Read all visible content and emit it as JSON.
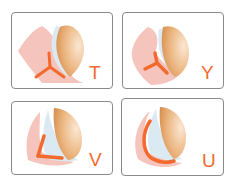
{
  "colors": {
    "accent": "#f26a2e",
    "tissue": "#f5c4bc",
    "membrane": "#dbe9f2",
    "cap": "#e0a265",
    "border": "#8a8a8a"
  },
  "panels": [
    {
      "label": "T",
      "shape": "t-incision"
    },
    {
      "label": "Y",
      "shape": "y-incision"
    },
    {
      "label": "V",
      "shape": "v-incision"
    },
    {
      "label": "U",
      "shape": "u-incision"
    }
  ]
}
